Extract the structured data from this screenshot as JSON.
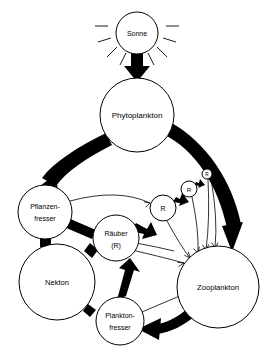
{
  "diagram": {
    "language": "de",
    "background_color": "#ffffff",
    "stroke_color": "#000000",
    "width": 273,
    "height": 355,
    "nodes": [
      {
        "id": "sonne",
        "label": "Sonne",
        "label_lines": [
          "Sonne"
        ],
        "cx": 137,
        "cy": 33,
        "r": 21,
        "size": "small",
        "has_rays": true
      },
      {
        "id": "phytoplankton",
        "label": "Phytoplankton",
        "label_lines": [
          "Phytoplankton"
        ],
        "cx": 137,
        "cy": 115,
        "r": 37,
        "size": "large",
        "has_rays": false
      },
      {
        "id": "pflanzenfresser",
        "label": "Pflanzenfresser",
        "label_lines": [
          "Pflanzen-",
          "fresser"
        ],
        "cx": 45,
        "cy": 212,
        "r": 27,
        "size": "medium",
        "has_rays": false
      },
      {
        "id": "nekton",
        "label": "Nekton",
        "label_lines": [
          "Nekton"
        ],
        "cx": 57,
        "cy": 282,
        "r": 38,
        "size": "large",
        "has_rays": false
      },
      {
        "id": "planktonfresser",
        "label": "Planktonfresser",
        "label_lines": [
          "Plankton-",
          "fresser"
        ],
        "cx": 120,
        "cy": 321,
        "r": 24,
        "size": "medium",
        "has_rays": false
      },
      {
        "id": "raeuber",
        "label": "Räuber (R)",
        "label_lines": [
          "Räuber",
          "(R)"
        ],
        "cx": 116,
        "cy": 238,
        "r": 23,
        "size": "medium",
        "has_rays": false
      },
      {
        "id": "zooplankton",
        "label": "Zooplankton",
        "label_lines": [
          "Zooplankton"
        ],
        "cx": 218,
        "cy": 287,
        "r": 41,
        "size": "large",
        "has_rays": false
      },
      {
        "id": "r1",
        "label": "R",
        "label_lines": [
          "R"
        ],
        "cx": 163,
        "cy": 208,
        "r": 13,
        "size": "tiny",
        "has_rays": false
      },
      {
        "id": "r2",
        "label": "R",
        "label_lines": [
          "R"
        ],
        "cx": 189,
        "cy": 189,
        "r": 8,
        "size": "tiny",
        "has_rays": false
      },
      {
        "id": "r3",
        "label": "R",
        "label_lines": [
          "R"
        ],
        "cx": 207,
        "cy": 174,
        "r": 5,
        "size": "tiny",
        "has_rays": false
      }
    ],
    "flows_thick": [
      {
        "id": "sonne-phyto",
        "from": "sonne",
        "to": "phytoplankton",
        "style": "straight-down"
      },
      {
        "id": "phyto-pflanzen",
        "from": "phytoplankton",
        "to": "pflanzenfresser",
        "style": "curve-left"
      },
      {
        "id": "phyto-zoo",
        "from": "phytoplankton",
        "to": "zooplankton",
        "style": "curve-right"
      },
      {
        "id": "zoo-plankton",
        "from": "zooplankton",
        "to": "planktonfresser",
        "style": "curve-bottom"
      },
      {
        "id": "pflanzen-raeuber",
        "from": "pflanzenfresser",
        "to": "raeuber",
        "style": "short"
      },
      {
        "id": "pflanzen-nekton",
        "from": "pflanzenfresser",
        "to": "nekton",
        "style": "short"
      },
      {
        "id": "nekton-raeuber",
        "from": "nekton",
        "to": "raeuber",
        "style": "short"
      },
      {
        "id": "nekton-plankton",
        "from": "nekton",
        "to": "planktonfresser",
        "style": "short"
      },
      {
        "id": "plankton-raeuber",
        "from": "planktonfresser",
        "to": "raeuber",
        "style": "short"
      },
      {
        "id": "raeuber-r1",
        "from": "raeuber",
        "to": "r1",
        "style": "short"
      },
      {
        "id": "r1-r2",
        "from": "r1",
        "to": "r2",
        "style": "short"
      },
      {
        "id": "r2-r3",
        "from": "r2",
        "to": "r3",
        "style": "short"
      }
    ],
    "flows_thin": [
      {
        "id": "pflanzen-r1",
        "from": "pflanzenfresser",
        "to": "r1"
      },
      {
        "id": "raeuber-zoo",
        "from": "raeuber",
        "to": "zooplankton"
      },
      {
        "id": "r1-zoo",
        "from": "r1",
        "to": "zooplankton"
      },
      {
        "id": "r2-zoo",
        "from": "r2",
        "to": "zooplankton"
      },
      {
        "id": "r3-zoo",
        "from": "r3",
        "to": "zooplankton"
      },
      {
        "id": "plankton-zoo",
        "from": "planktonfresser",
        "to": "zooplankton"
      }
    ]
  }
}
